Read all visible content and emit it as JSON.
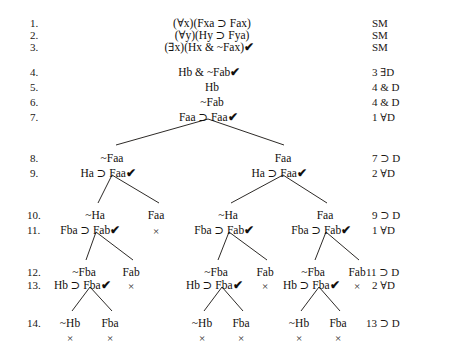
{
  "document": {
    "kind": "logic-truth-tree-proof",
    "title": "Predicate logic truth tree"
  },
  "symbols": {
    "universal": "∀",
    "existential": "∃",
    "horseshoe": "⊃",
    "negation": "~",
    "ampersand": "&",
    "check": "✔",
    "close": "×"
  },
  "line_numbers": [
    {
      "label": "1.",
      "x": 30,
      "y": 18
    },
    {
      "label": "2.",
      "x": 30,
      "y": 30
    },
    {
      "label": "3.",
      "x": 30,
      "y": 42
    },
    {
      "label": "4.",
      "x": 30,
      "y": 67
    },
    {
      "label": "5.",
      "x": 30,
      "y": 82
    },
    {
      "label": "6.",
      "x": 30,
      "y": 97
    },
    {
      "label": "7.",
      "x": 30,
      "y": 112
    },
    {
      "label": "8.",
      "x": 30,
      "y": 153
    },
    {
      "label": "9.",
      "x": 30,
      "y": 168
    },
    {
      "label": "10.",
      "x": 27,
      "y": 210
    },
    {
      "label": "11.",
      "x": 27,
      "y": 225
    },
    {
      "label": "12.",
      "x": 27,
      "y": 267
    },
    {
      "label": "13.",
      "x": 27,
      "y": 280
    },
    {
      "label": "14.",
      "x": 27,
      "y": 318
    }
  ],
  "justifications": [
    {
      "label": "SM",
      "x": 372,
      "y": 18
    },
    {
      "label": "SM",
      "x": 372,
      "y": 30
    },
    {
      "label": "SM",
      "x": 372,
      "y": 42
    },
    {
      "label": "3 ∃D",
      "x": 372,
      "y": 67
    },
    {
      "label": "4 & D",
      "x": 372,
      "y": 82
    },
    {
      "label": "4 & D",
      "x": 372,
      "y": 97
    },
    {
      "label": "1 ∀D",
      "x": 372,
      "y": 112
    },
    {
      "label": "7 ⊃ D",
      "x": 372,
      "y": 153
    },
    {
      "label": "2 ∀D",
      "x": 372,
      "y": 168
    },
    {
      "label": "9 ⊃ D",
      "x": 372,
      "y": 210
    },
    {
      "label": "1 ∀D",
      "x": 372,
      "y": 225
    },
    {
      "label": "11 ⊃ D",
      "x": 366,
      "y": 267
    },
    {
      "label": "2 ∀D",
      "x": 372,
      "y": 280
    },
    {
      "label": "13 ⊃ D",
      "x": 366,
      "y": 318
    }
  ],
  "nodes": [
    {
      "text": "(∀x)(Fxa ⊃ Fax)",
      "x": 212,
      "y": 18,
      "checked": false
    },
    {
      "text": "(∀y)(Hy ⊃ Fya)",
      "x": 212,
      "y": 30,
      "checked": false
    },
    {
      "text": "(∃x)(Hx &  ~Fax)",
      "x": 209,
      "y": 42,
      "checked": true
    },
    {
      "text": "Hb &  ~Fab",
      "x": 209,
      "y": 67,
      "checked": true
    },
    {
      "text": "Hb",
      "x": 212,
      "y": 82,
      "checked": false
    },
    {
      "text": "~Fab",
      "x": 212,
      "y": 97,
      "checked": false
    },
    {
      "text": "Faa ⊃ Faa",
      "x": 208,
      "y": 112,
      "checked": true
    },
    {
      "text": "~Faa",
      "x": 112,
      "y": 153,
      "checked": false
    },
    {
      "text": "Faa",
      "x": 283,
      "y": 153,
      "checked": false
    },
    {
      "text": "Ha ⊃ Faa",
      "x": 108,
      "y": 168,
      "checked": true
    },
    {
      "text": "Ha ⊃ Faa",
      "x": 279,
      "y": 168,
      "checked": true
    },
    {
      "text": "~Ha",
      "x": 95,
      "y": 210,
      "checked": false
    },
    {
      "text": "Faa",
      "x": 156,
      "y": 210,
      "checked": false
    },
    {
      "text": "~Ha",
      "x": 228,
      "y": 210,
      "checked": false
    },
    {
      "text": "Faa",
      "x": 325,
      "y": 210,
      "checked": false
    },
    {
      "text": "Fba ⊃ Fab",
      "x": 90,
      "y": 225,
      "checked": true
    },
    {
      "text": "Fba ⊃ Fab",
      "x": 224,
      "y": 225,
      "checked": true
    },
    {
      "text": "Fba ⊃ Fab",
      "x": 321,
      "y": 225,
      "checked": true
    },
    {
      "text": "~Fba",
      "x": 84,
      "y": 267,
      "checked": false
    },
    {
      "text": "Fab",
      "x": 131,
      "y": 267,
      "checked": false
    },
    {
      "text": "~Fba",
      "x": 216,
      "y": 267,
      "checked": false
    },
    {
      "text": "Fab",
      "x": 265,
      "y": 267,
      "checked": false
    },
    {
      "text": "~Fba",
      "x": 313,
      "y": 267,
      "checked": false
    },
    {
      "text": "Fab",
      "x": 357,
      "y": 267,
      "checked": false
    },
    {
      "text": "Hb ⊃ Fba",
      "x": 82,
      "y": 280,
      "checked": true
    },
    {
      "text": "Hb ⊃ Fba",
      "x": 214,
      "y": 280,
      "checked": true
    },
    {
      "text": "Hb ⊃ Fba",
      "x": 311,
      "y": 280,
      "checked": true
    },
    {
      "text": "~Hb",
      "x": 70,
      "y": 318,
      "checked": false
    },
    {
      "text": "Fba",
      "x": 110,
      "y": 318,
      "checked": false
    },
    {
      "text": "~Hb",
      "x": 202,
      "y": 318,
      "checked": false
    },
    {
      "text": "Fba",
      "x": 241,
      "y": 318,
      "checked": false
    },
    {
      "text": "~Hb",
      "x": 299,
      "y": 318,
      "checked": false
    },
    {
      "text": "Fba",
      "x": 338,
      "y": 318,
      "checked": false
    }
  ],
  "closure_marks": [
    {
      "x": 156,
      "y": 226
    },
    {
      "x": 131,
      "y": 281
    },
    {
      "x": 265,
      "y": 281
    },
    {
      "x": 357,
      "y": 281
    },
    {
      "x": 70,
      "y": 333
    },
    {
      "x": 110,
      "y": 333
    },
    {
      "x": 202,
      "y": 333
    },
    {
      "x": 241,
      "y": 333
    },
    {
      "x": 299,
      "y": 333
    },
    {
      "x": 338,
      "y": 333
    }
  ],
  "branch_lines": [
    {
      "x1": 208,
      "y1": 119,
      "x2": 116,
      "y2": 145
    },
    {
      "x1": 208,
      "y1": 119,
      "x2": 284,
      "y2": 145
    },
    {
      "x1": 112,
      "y1": 175,
      "x2": 98,
      "y2": 203
    },
    {
      "x1": 112,
      "y1": 175,
      "x2": 159,
      "y2": 203
    },
    {
      "x1": 283,
      "y1": 175,
      "x2": 231,
      "y2": 203
    },
    {
      "x1": 283,
      "y1": 175,
      "x2": 327,
      "y2": 203
    },
    {
      "x1": 96,
      "y1": 232,
      "x2": 86,
      "y2": 260
    },
    {
      "x1": 96,
      "y1": 232,
      "x2": 133,
      "y2": 260
    },
    {
      "x1": 229,
      "y1": 232,
      "x2": 218,
      "y2": 260
    },
    {
      "x1": 229,
      "y1": 232,
      "x2": 267,
      "y2": 260
    },
    {
      "x1": 326,
      "y1": 232,
      "x2": 315,
      "y2": 260
    },
    {
      "x1": 326,
      "y1": 232,
      "x2": 359,
      "y2": 260
    },
    {
      "x1": 90,
      "y1": 287,
      "x2": 72,
      "y2": 311
    },
    {
      "x1": 90,
      "y1": 287,
      "x2": 112,
      "y2": 311
    },
    {
      "x1": 222,
      "y1": 287,
      "x2": 204,
      "y2": 311
    },
    {
      "x1": 222,
      "y1": 287,
      "x2": 243,
      "y2": 311
    },
    {
      "x1": 319,
      "y1": 287,
      "x2": 301,
      "y2": 311
    },
    {
      "x1": 319,
      "y1": 287,
      "x2": 340,
      "y2": 311
    }
  ]
}
